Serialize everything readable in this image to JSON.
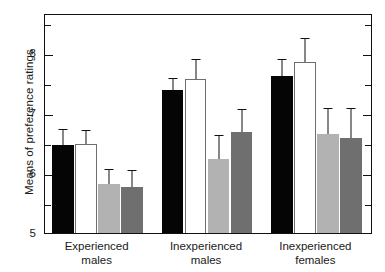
{
  "chart_data": {
    "type": "bar",
    "title": "",
    "xlabel": "",
    "ylabel": "Means of preference ratings",
    "ylim": [
      5,
      8.66
    ],
    "yticks_major": [
      5,
      6,
      7,
      8
    ],
    "yticks_minor": [
      5.5,
      6.5,
      7.5,
      8.5
    ],
    "ytick_labels": [
      "5",
      "6",
      "7",
      "8"
    ],
    "grid": false,
    "legend": "none",
    "categories": [
      "Experienced males",
      "Inexperienced males",
      "Inexperienced females"
    ],
    "category_lines": [
      [
        "Experienced",
        "males"
      ],
      [
        "Inexperienced",
        "males"
      ],
      [
        "Inexperienced",
        "females"
      ]
    ],
    "series": [
      {
        "name": "bar-1",
        "fill": "black",
        "color": "#050505",
        "values": [
          6.5,
          7.42,
          7.65
        ],
        "errors": [
          0.27,
          0.2,
          0.28
        ]
      },
      {
        "name": "bar-2",
        "fill": "white",
        "color": "#ffffff",
        "values": [
          6.52,
          7.6,
          7.88
        ],
        "errors": [
          0.23,
          0.32,
          0.4
        ]
      },
      {
        "name": "bar-3",
        "fill": "light-gray",
        "color": "#b2b2b2",
        "values": [
          5.85,
          6.27,
          6.68
        ],
        "errors": [
          0.24,
          0.4,
          0.43
        ]
      },
      {
        "name": "bar-4",
        "fill": "dark-gray",
        "color": "#6f6f6f",
        "values": [
          5.8,
          6.72,
          6.62
        ],
        "errors": [
          0.28,
          0.38,
          0.5
        ]
      }
    ]
  }
}
